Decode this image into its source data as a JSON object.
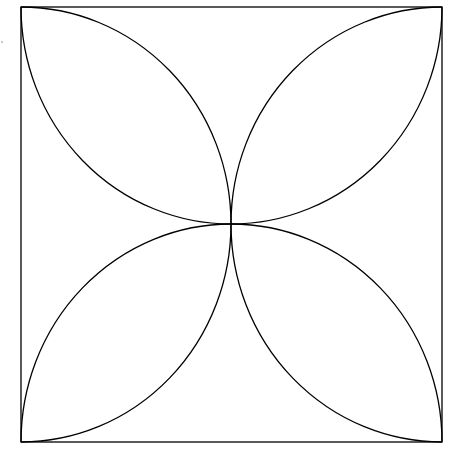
{
  "diagram": {
    "title": "",
    "stroke_color": "#000000",
    "background_color": "#ffffff",
    "shapes": [
      {
        "name": "outer-square",
        "type": "square"
      },
      {
        "name": "petal-top-left",
        "type": "lens",
        "from": "top-left-corner",
        "to": "center"
      },
      {
        "name": "petal-top-right",
        "type": "lens",
        "from": "top-right-corner",
        "to": "center"
      },
      {
        "name": "petal-bottom-left",
        "type": "lens",
        "from": "bottom-left-corner",
        "to": "center"
      },
      {
        "name": "petal-bottom-right",
        "type": "lens",
        "from": "bottom-right-corner",
        "to": "center"
      }
    ]
  }
}
